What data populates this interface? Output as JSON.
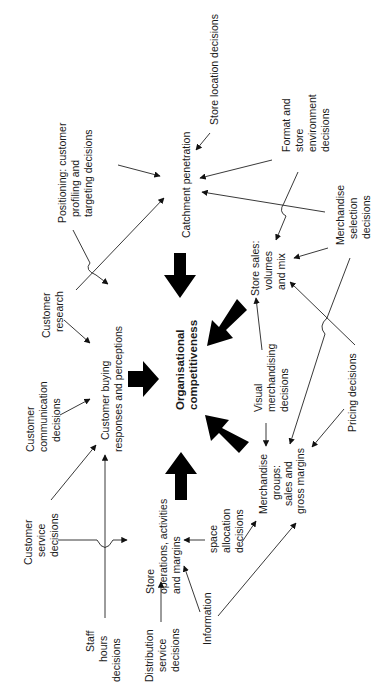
{
  "diagram": {
    "title": "Organisational competitiveness",
    "orientation": "rotated 90 degrees counter-clockwise",
    "central_node": {
      "label_line1": "Organisational",
      "label_line2": "competitiveness"
    },
    "primary_nodes": {
      "catchment": {
        "line1": "Catchment penetration"
      },
      "customer_buying": {
        "line1": "Customer buying",
        "line2": "responses and perceptions"
      },
      "store_ops": {
        "line1": "Store",
        "line2": "operations, activities",
        "line3": "and margins"
      },
      "store_sales": {
        "line1": "Store sales:",
        "line2": "volumes",
        "line3": "and mix"
      },
      "merch_groups": {
        "line1": "Merchandise",
        "line2": "groups:",
        "line3": "sales and",
        "line4": "gross margins"
      }
    },
    "decision_nodes": {
      "store_location": {
        "line1": "Store location decisions"
      },
      "positioning": {
        "line1": "Positioning: customer",
        "line2": "profiling and",
        "line3": "targeting decisions"
      },
      "format": {
        "line1": "Format and",
        "line2": "store",
        "line3": "environment",
        "line4": "decisions"
      },
      "merch_selection": {
        "line1": "Merchandise",
        "line2": "selection",
        "line3": "decisions"
      },
      "customer_research": {
        "line1": "Customer",
        "line2": "research"
      },
      "customer_comm": {
        "line1": "Customer",
        "line2": "communication",
        "line3": "decisions"
      },
      "visual_merch": {
        "line1": "Visual",
        "line2": "merchandising",
        "line3": "decisions"
      },
      "pricing": {
        "line1": "Pricing decisions"
      },
      "customer_service": {
        "line1": "Customer",
        "line2": "service",
        "line3": "decisions"
      },
      "staff_hours": {
        "line1": "Staff",
        "line2": "hours",
        "line3": "decisions"
      },
      "distribution": {
        "line1": "Distribution",
        "line2": "service",
        "line3": "decisions"
      },
      "space_allocation": {
        "line1": "space",
        "line2": "allocation",
        "line3": "decisions"
      },
      "information": {
        "line1": "Information"
      }
    },
    "colors": {
      "line": "#222222",
      "arrow": "#000000",
      "background": "#ffffff"
    }
  }
}
